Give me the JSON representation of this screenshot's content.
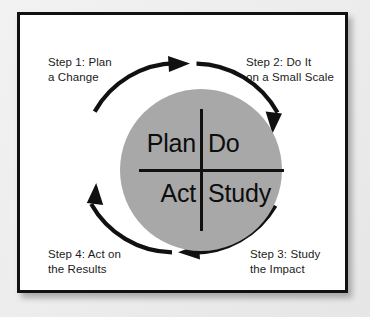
{
  "diagram": {
    "colors": {
      "circle_fill": "#a8a8a8",
      "stroke": "#111111",
      "panel_background": "#ffffff",
      "page_background": "#eeeeee"
    },
    "cycle_direction": "clockwise",
    "quadrants": [
      {
        "key": "plan",
        "label": "Plan",
        "position": "top-left"
      },
      {
        "key": "do",
        "label": "Do",
        "position": "top-right"
      },
      {
        "key": "act",
        "label": "Act",
        "position": "bottom-left"
      },
      {
        "key": "study",
        "label": "Study",
        "position": "bottom-right"
      }
    ],
    "steps": [
      {
        "number": 1,
        "label": "Step 1: Plan\na Change",
        "position": "top-left",
        "arrow": "arc-arrow-top"
      },
      {
        "number": 2,
        "label": "Step 2: Do It\non a Small Scale",
        "position": "top-right",
        "arrow": "arc-arrow-right"
      },
      {
        "number": 3,
        "label": "Step 3: Study\nthe Impact",
        "position": "bottom-right",
        "arrow": "arc-arrow-bottom"
      },
      {
        "number": 4,
        "label": "Step 4: Act on\nthe Results",
        "position": "bottom-left",
        "arrow": "arc-arrow-left"
      }
    ]
  }
}
